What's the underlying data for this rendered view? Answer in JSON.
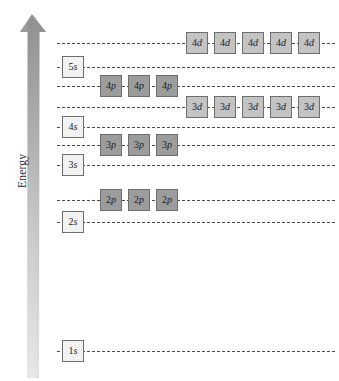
{
  "figure": {
    "type": "energy-level-diagram",
    "title": "",
    "background_color": "#ffffff"
  },
  "axis": {
    "label": "Energy",
    "direction": "up",
    "arrow_name": "energy-arrow",
    "gradient_top_color": "#8f8f8f",
    "gradient_bottom_color": "#e3e3e3"
  },
  "style": {
    "line_color": "#4a4a4a",
    "box_border_color": "#6e6e6e",
    "s_box_color": "#f2f2f2",
    "p_box_color": "#9c9c9c",
    "d_box_color": "#c3c3c3",
    "line_left_x": 57,
    "line_right_x": 335
  },
  "levels": [
    {
      "id": "4d",
      "n": "4",
      "l": "d",
      "subshell": "d",
      "count": 5,
      "y": 32,
      "boxes_left": 186,
      "labels": [
        "4d",
        "4d",
        "4d",
        "4d",
        "4d"
      ]
    },
    {
      "id": "5s",
      "n": "5",
      "l": "s",
      "subshell": "s",
      "count": 1,
      "y": 56,
      "boxes_left": 62,
      "labels": [
        "5s"
      ]
    },
    {
      "id": "4p",
      "n": "4",
      "l": "p",
      "subshell": "p",
      "count": 3,
      "y": 75,
      "boxes_left": 100,
      "labels": [
        "4p",
        "4p",
        "4p"
      ]
    },
    {
      "id": "3d",
      "n": "3",
      "l": "d",
      "subshell": "d",
      "count": 5,
      "y": 96,
      "boxes_left": 186,
      "labels": [
        "3d",
        "3d",
        "3d",
        "3d",
        "3d"
      ]
    },
    {
      "id": "4s",
      "n": "4",
      "l": "s",
      "subshell": "s",
      "count": 1,
      "y": 116,
      "boxes_left": 62,
      "labels": [
        "4s"
      ]
    },
    {
      "id": "3p",
      "n": "3",
      "l": "p",
      "subshell": "p",
      "count": 3,
      "y": 134,
      "boxes_left": 100,
      "labels": [
        "3p",
        "3p",
        "3p"
      ]
    },
    {
      "id": "3s",
      "n": "3",
      "l": "s",
      "subshell": "s",
      "count": 1,
      "y": 154,
      "boxes_left": 62,
      "labels": [
        "3s"
      ]
    },
    {
      "id": "2p",
      "n": "2",
      "l": "p",
      "subshell": "p",
      "count": 3,
      "y": 189,
      "boxes_left": 100,
      "labels": [
        "2p",
        "2p",
        "2p"
      ]
    },
    {
      "id": "2s",
      "n": "2",
      "l": "s",
      "subshell": "s",
      "count": 1,
      "y": 211,
      "boxes_left": 62,
      "labels": [
        "2s"
      ]
    },
    {
      "id": "1s",
      "n": "1",
      "l": "s",
      "subshell": "s",
      "count": 1,
      "y": 340,
      "boxes_left": 62,
      "labels": [
        "1s"
      ]
    }
  ]
}
